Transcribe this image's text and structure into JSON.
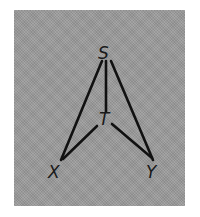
{
  "diagram": {
    "type": "graph",
    "background_color": "#9a9a9a",
    "line_color": "#111111",
    "nodes": [
      {
        "id": "S",
        "label": "S",
        "x": 104,
        "y": 58
      },
      {
        "id": "T",
        "label": "T",
        "x": 105,
        "y": 124
      },
      {
        "id": "X",
        "label": "X",
        "x": 55,
        "y": 176
      },
      {
        "id": "Y",
        "label": "Y",
        "x": 152,
        "y": 176
      }
    ],
    "edges": [
      {
        "from": "S",
        "to": "X"
      },
      {
        "from": "S",
        "to": "T"
      },
      {
        "from": "S",
        "to": "Y"
      },
      {
        "from": "T",
        "to": "X"
      },
      {
        "from": "T",
        "to": "Y"
      }
    ]
  }
}
